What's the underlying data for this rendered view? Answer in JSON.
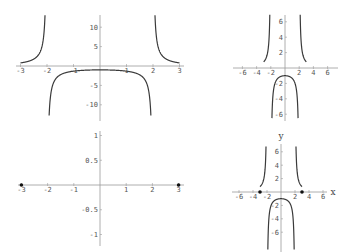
{
  "chart_data": [
    {
      "id": "plot-top-left",
      "type": "line",
      "function": "4/(x^2-4)",
      "title": "",
      "xlabel": "",
      "ylabel": "",
      "xlim": [
        -3,
        3
      ],
      "ylim": [
        -14,
        13
      ],
      "x_ticks": [
        -3,
        -2,
        -1,
        1,
        2,
        3
      ],
      "y_ticks": [
        -10,
        -5,
        5,
        10
      ],
      "grid": false,
      "legend": null,
      "series": [
        {
          "name": "f(x)",
          "domain": [
            -3,
            3
          ],
          "asymptotes": [
            -2,
            2
          ]
        }
      ],
      "endpoints": []
    },
    {
      "id": "plot-bottom-left",
      "type": "scatter",
      "title": "",
      "xlabel": "",
      "ylabel": "",
      "xlim": [
        -3,
        3
      ],
      "ylim": [
        -1,
        1
      ],
      "x_ticks": [
        -3,
        -2,
        -1,
        1,
        2,
        3
      ],
      "y_ticks": [
        -1,
        -0.5,
        0.5,
        1
      ],
      "grid": false,
      "legend": null,
      "series": [
        {
          "name": "points",
          "x": [
            -3,
            3
          ],
          "y": [
            0,
            0
          ]
        }
      ],
      "endpoints": [
        [
          -3,
          0
        ],
        [
          3,
          0
        ]
      ]
    },
    {
      "id": "plot-top-right",
      "type": "line",
      "function": "4/(x^2-4)",
      "title": "",
      "xlabel": "",
      "ylabel": "",
      "xlim": [
        -7,
        7
      ],
      "ylim": [
        -7,
        7
      ],
      "x_ticks": [
        -6,
        -4,
        -2,
        2,
        4,
        6
      ],
      "y_ticks": [
        -6,
        -4,
        -2,
        2,
        4,
        6
      ],
      "grid": false,
      "legend": null,
      "series": [
        {
          "name": "f(x)",
          "domain": [
            -3,
            3
          ],
          "asymptotes": [
            -2,
            2
          ]
        }
      ],
      "endpoints": []
    },
    {
      "id": "plot-bottom-right",
      "type": "line",
      "function": "4/(x^2-4)",
      "title": "",
      "xlabel": "x",
      "ylabel": "y",
      "xlim": [
        -7,
        7
      ],
      "ylim": [
        -8,
        7
      ],
      "x_ticks": [
        -6,
        -4,
        -2,
        2,
        4,
        6
      ],
      "y_ticks": [
        -6,
        -4,
        -2,
        2,
        4,
        6
      ],
      "grid": false,
      "legend": null,
      "series": [
        {
          "name": "f(x)",
          "domain": [
            -3,
            3
          ],
          "asymptotes": [
            -2,
            2
          ]
        }
      ],
      "endpoints": [
        [
          -3,
          0
        ],
        [
          3,
          0
        ]
      ]
    }
  ],
  "layout": [
    {
      "x0": 100,
      "y0": 66,
      "sx": 26.5,
      "sy": 3.88,
      "xa": [
        16,
        184
      ],
      "ya": [
        15,
        121
      ],
      "curve": [
        -3,
        3
      ],
      "ylimits": [
        -14,
        13.5
      ],
      "color": "#333333"
    },
    {
      "x0": 100,
      "y0": 185,
      "sx": 26.2,
      "sy": 49.5,
      "xa": [
        18,
        184
      ],
      "ya": [
        131,
        246
      ]
    },
    {
      "x0": 285,
      "y0": 68,
      "sx": 7.1,
      "sy": 7.7,
      "xa": [
        233,
        338
      ],
      "ya": [
        15,
        121
      ],
      "curve": [
        -3,
        3
      ],
      "ylimits": [
        -6.9,
        7
      ]
    },
    {
      "x0": 281,
      "y0": 192,
      "sx": 7.0,
      "sy": 6.7,
      "xa": [
        232,
        327
      ],
      "ya": [
        144,
        252
      ],
      "curve": [
        -3,
        3
      ],
      "ylimits": [
        -9,
        6.9
      ]
    }
  ],
  "colors": {
    "curve": "#3a3a3a",
    "axis": "#9a9a9a",
    "label": "#555555",
    "point": "#111111"
  }
}
